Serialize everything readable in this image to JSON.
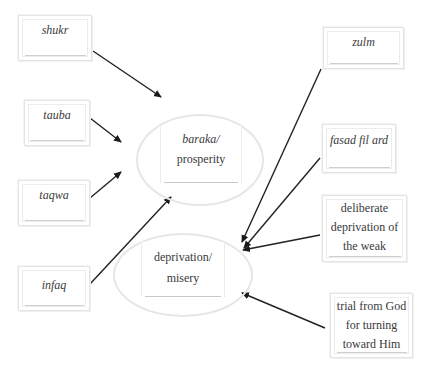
{
  "diagram": {
    "causes_positive": [
      {
        "id": "shukr",
        "label": "shukr",
        "italic": true
      },
      {
        "id": "tauba",
        "label": "tauba",
        "italic": true
      },
      {
        "id": "taqwa",
        "label": "taqwa",
        "italic": true
      },
      {
        "id": "infaq",
        "label": "infaq",
        "italic": true
      }
    ],
    "causes_negative": [
      {
        "id": "zulm",
        "label": "zulm",
        "italic": true
      },
      {
        "id": "fasad",
        "label": "fasad fil ard",
        "italic": true
      },
      {
        "id": "deliberate",
        "lines": [
          "deliberate",
          "deprivation of",
          "the weak"
        ],
        "italic": false
      },
      {
        "id": "trial",
        "lines": [
          "trial from God",
          "for turning",
          "toward Him"
        ],
        "italic": false
      }
    ],
    "outcomes": [
      {
        "id": "baraka",
        "line1": "baraka/",
        "line2": "prosperity"
      },
      {
        "id": "deprivation",
        "line1": "deprivation/",
        "line2": "misery"
      }
    ],
    "edges": [
      {
        "from": "shukr",
        "to": "baraka"
      },
      {
        "from": "tauba",
        "to": "baraka"
      },
      {
        "from": "taqwa",
        "to": "baraka"
      },
      {
        "from": "infaq",
        "to": "baraka"
      },
      {
        "from": "zulm",
        "to": "deprivation"
      },
      {
        "from": "fasad",
        "to": "deprivation"
      },
      {
        "from": "deliberate",
        "to": "deprivation"
      },
      {
        "from": "trial",
        "to": "deprivation"
      }
    ]
  }
}
